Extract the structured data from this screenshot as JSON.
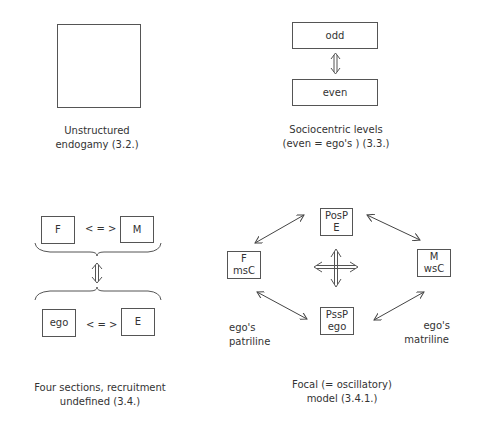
{
  "panels": {
    "unstructured": {
      "caption_line1": "Unstructured",
      "caption_line2": "endogamy (3.2.)"
    },
    "sociocentric": {
      "top_box": "odd",
      "bottom_box": "even",
      "caption_line1": "Sociocentric levels",
      "caption_line2": "(even = ego's )  (3.3.)"
    },
    "four_sections": {
      "top_left_box": "F",
      "top_right_box": "M",
      "top_relation": "< = >",
      "bottom_left_box": "ego",
      "bottom_right_box": "E",
      "bottom_relation": "< = >",
      "caption_line1": "Four sections, recruitment",
      "caption_line2": "undefined (3.4.)"
    },
    "focal": {
      "top_box_line1": "PosP",
      "top_box_line2": "E",
      "left_box_line1": "F",
      "left_box_line2": "msC",
      "right_box_line1": "M",
      "right_box_line2": "wsC",
      "bottom_box_line1": "PssP",
      "bottom_box_line2": "ego",
      "left_label_line1": "ego's",
      "left_label_line2": "patriline",
      "right_label_line1": "ego's",
      "right_label_line2": "matriline",
      "caption_line1": "Focal (= oscillatory)",
      "caption_line2": "model (3.4.1.)"
    }
  }
}
